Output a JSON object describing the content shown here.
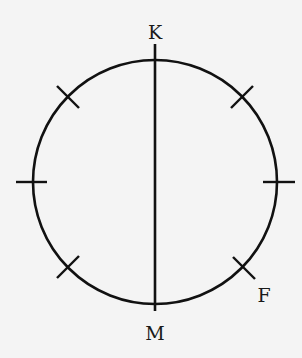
{
  "diagram": {
    "type": "circle-with-diameter-and-tick-marks",
    "circle": {
      "cx": 155,
      "cy": 182,
      "r": 122
    },
    "diameter": {
      "from_label": "K",
      "to_label": "M",
      "orientation": "vertical"
    },
    "tick_marks": [
      {
        "angle_deg": 135,
        "label": ""
      },
      {
        "angle_deg": 45,
        "label": ""
      },
      {
        "angle_deg": 180,
        "label": ""
      },
      {
        "angle_deg": 0,
        "label": ""
      },
      {
        "angle_deg": 225,
        "label": ""
      },
      {
        "angle_deg": 315,
        "label": "F"
      }
    ],
    "labels": {
      "top": "K",
      "bottom": "M",
      "point_f": "F"
    },
    "stroke_color": "#111111",
    "background_color": "#f4f4f4"
  }
}
